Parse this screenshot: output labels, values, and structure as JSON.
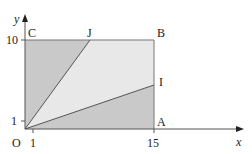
{
  "diagram": {
    "axes": {
      "x_label": "x",
      "y_label": "y",
      "origin_label": "O",
      "x_ticks": [
        "1",
        "15"
      ],
      "y_ticks": [
        "1",
        "10"
      ]
    },
    "points": {
      "A": "A",
      "B": "B",
      "C": "C",
      "I": "I",
      "J": "J"
    },
    "colors": {
      "dark_region": "#c9c9c9",
      "light_region": "#e6e6e6",
      "lines": "#555555"
    }
  }
}
